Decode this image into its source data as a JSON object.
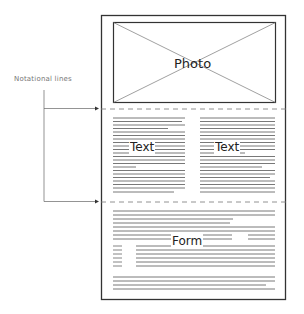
{
  "diagram": {
    "annotation_label": "Notational lines",
    "sections": {
      "photo": {
        "label": "Photo"
      },
      "text_left": {
        "label": "Text"
      },
      "text_right": {
        "label": "Text"
      },
      "form": {
        "label": "Form"
      }
    },
    "colors": {
      "border": "#333333",
      "text_lines": "#555555",
      "dashed": "#777777",
      "annotation": "#777777"
    }
  }
}
